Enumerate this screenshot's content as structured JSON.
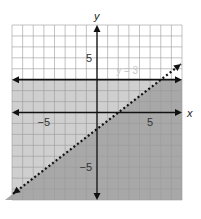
{
  "chart_data": {
    "type": "line",
    "title": "",
    "xlabel": "x",
    "ylabel": "y",
    "xlim": [
      -8,
      8
    ],
    "ylim": [
      -8,
      8
    ],
    "grid": true,
    "x_tick_labels": [
      {
        "value": -5,
        "label": "−5"
      },
      {
        "value": 5,
        "label": "5"
      }
    ],
    "y_tick_labels": [
      {
        "value": 5,
        "label": "5"
      },
      {
        "value": -5,
        "label": "−5"
      }
    ],
    "series": [
      {
        "name": "y = 3",
        "kind": "solid",
        "slope": 0,
        "intercept": 3,
        "label": "y = 3"
      },
      {
        "name": "boundary",
        "kind": "dotted",
        "slope": 0.75,
        "intercept": -1.5,
        "label": ""
      }
    ],
    "shading": [
      {
        "region": "y < 3",
        "color": "#c9c9c9"
      },
      {
        "region": "y < 0.75x - 1.5 and y < 3",
        "color": "#a9a9a9"
      }
    ],
    "colors": {
      "grid": "#9a9a9a",
      "axis": "#111111",
      "light_shade": "#cfcfcf",
      "dark_shade": "#a8a8a8",
      "label_faint": "#c8c8c8"
    }
  }
}
